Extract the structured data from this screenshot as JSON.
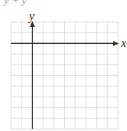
{
  "top_fragment": "y + y",
  "graph": {
    "y_axis_label": "y",
    "x_axis_label": "x",
    "grid": {
      "columns": 10,
      "rows": 10,
      "x0": 11,
      "y0": 22,
      "cell": 10.7
    },
    "y_axis_column": 2,
    "x_axis_row": 2,
    "colors": {
      "grid": "#d9d9d9",
      "axis": "#333333"
    }
  }
}
